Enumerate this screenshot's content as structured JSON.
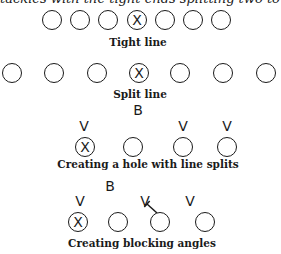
{
  "header_text": "tackles with the tight ends splitting two to four feet",
  "diagrams": [
    {
      "id": "tight-line",
      "caption": "Tight line",
      "caption_pos": {
        "x": 138,
        "y": 36
      },
      "players": [
        {
          "x": 52,
          "y": 20,
          "center": false
        },
        {
          "x": 80,
          "y": 20,
          "center": false
        },
        {
          "x": 108,
          "y": 20,
          "center": false
        },
        {
          "x": 137,
          "y": 20,
          "center": true,
          "label": "X"
        },
        {
          "x": 165,
          "y": 20,
          "center": false
        },
        {
          "x": 193,
          "y": 20,
          "center": false
        },
        {
          "x": 221,
          "y": 20,
          "center": false
        }
      ]
    },
    {
      "id": "split-line",
      "caption": "Split line",
      "caption_pos": {
        "x": 140,
        "y": 88
      },
      "players": [
        {
          "x": 12,
          "y": 73,
          "center": false
        },
        {
          "x": 54,
          "y": 73,
          "center": false
        },
        {
          "x": 97,
          "y": 73,
          "center": false
        },
        {
          "x": 139,
          "y": 73,
          "center": true,
          "label": "X"
        },
        {
          "x": 180,
          "y": 73,
          "center": false
        },
        {
          "x": 223,
          "y": 73,
          "center": false
        },
        {
          "x": 266,
          "y": 73,
          "center": false
        }
      ]
    },
    {
      "id": "hole-with-splits",
      "caption": "Creating a hole with line splits",
      "caption_pos": {
        "x": 148,
        "y": 158
      },
      "back_label": "B",
      "back_pos": {
        "x": 138,
        "y": 103
      },
      "defenders": [
        {
          "label": "V",
          "x": 84,
          "y": 119
        },
        {
          "label": "V",
          "x": 183,
          "y": 119
        },
        {
          "label": "V",
          "x": 227,
          "y": 119
        }
      ],
      "players": [
        {
          "x": 85,
          "y": 147,
          "center": true,
          "label": "X"
        },
        {
          "x": 133,
          "y": 147,
          "center": false
        },
        {
          "x": 183,
          "y": 147,
          "center": false
        },
        {
          "x": 227,
          "y": 147,
          "center": false
        }
      ]
    },
    {
      "id": "blocking-angles",
      "caption": "Creating blocking angles",
      "caption_pos": {
        "x": 142,
        "y": 237
      },
      "back_label": "B",
      "back_pos": {
        "x": 110,
        "y": 179
      },
      "defenders": [
        {
          "label": "V",
          "x": 80,
          "y": 194
        },
        {
          "label": "V",
          "x": 145,
          "y": 194
        },
        {
          "label": "V",
          "x": 190,
          "y": 194
        }
      ],
      "players": [
        {
          "x": 78,
          "y": 222,
          "center": true,
          "label": "X"
        },
        {
          "x": 118,
          "y": 222,
          "center": false
        },
        {
          "x": 160,
          "y": 222,
          "center": false
        },
        {
          "x": 205,
          "y": 222,
          "center": false
        }
      ],
      "block_line": {
        "x1": 157,
        "y1": 213,
        "x2": 147,
        "y2": 204
      }
    }
  ],
  "colors": {
    "ink": "#1a1a1a",
    "background": "#ffffff"
  }
}
